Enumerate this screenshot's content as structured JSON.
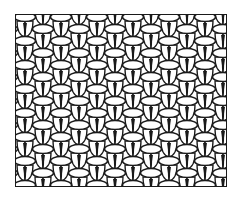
{
  "illustration": {
    "subject": "knit stitch texture pattern (basketweave of stitches)",
    "description": "Black ink line drawing of interlocking knitted stitches: horizontal oval loops alternating with pairs of vertical leg loops in a staggered grid",
    "colors": {
      "ink": "#1a1a1a",
      "fill": "#ffffff",
      "background": "#ffffff"
    },
    "frame": {
      "x": 15,
      "y": 14,
      "width": 212,
      "height": 173
    },
    "pattern": {
      "column_width": 18,
      "row_height": 24,
      "columns": 12,
      "rows": 8
    }
  }
}
